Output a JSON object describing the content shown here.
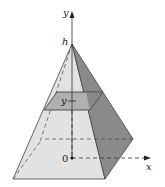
{
  "diagram": {
    "labels": {
      "y_axis": "y",
      "x_axis": "x",
      "height": "h",
      "origin": "0",
      "section": "y"
    },
    "colors": {
      "front_face": "#e2e2e2",
      "right_face": "#8a8a8a",
      "section": "#b0b0b0",
      "section_dark": "#6e6e6e",
      "edge": "#333333"
    }
  }
}
